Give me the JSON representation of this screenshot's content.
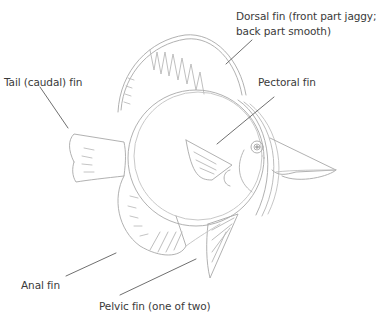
{
  "diagram": {
    "colors": {
      "background": "#ffffff",
      "label_text": "#3a3a3a",
      "leader_line": "#4a4a4a",
      "sketch_stroke": "#a8a8a8"
    },
    "labels": {
      "dorsal_line1": "Dorsal fin (front part jaggy;",
      "dorsal_line2": "back part smooth)",
      "tail": "Tail (caudal) fin",
      "pectoral": "Pectoral fin",
      "anal": "Anal fin",
      "pelvic": "Pelvic fin (one of two)"
    }
  }
}
